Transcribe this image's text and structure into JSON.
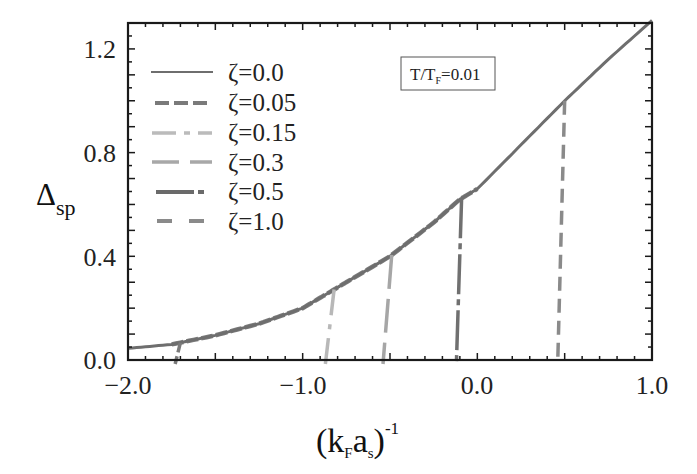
{
  "chart_data": {
    "type": "line",
    "title": "",
    "xlabel": "(k_F a_s)^-1",
    "xlabel_parts": {
      "open": "(k",
      "sub1": "F",
      "mid": "a",
      "sub2": "s",
      "close": ")",
      "sup": "-1"
    },
    "ylabel": "Δ_sp",
    "ylabel_parts": {
      "main": "Δ",
      "sub": "sp"
    },
    "xlim": [
      -2.0,
      1.0
    ],
    "ylim": [
      0.0,
      1.3
    ],
    "xticks": [
      -2.0,
      -1.0,
      0.0,
      1.0
    ],
    "xtick_labels": [
      "−2.0",
      "−1.0",
      "0.0",
      "1.0"
    ],
    "yticks": [
      0.0,
      0.4,
      0.8,
      1.2
    ],
    "ytick_labels": [
      "0.0",
      "0.4",
      "0.8",
      "1.2"
    ],
    "grid": false,
    "legend_position": "upper left",
    "annotation": {
      "text_main": "T/T",
      "text_sub": "F",
      "text_rest": "=0.01"
    },
    "series": [
      {
        "name": "ζ=0.0",
        "style": "solid",
        "color": "#6e6e6e",
        "x": [
          -2.0,
          -1.75,
          -1.5,
          -1.25,
          -1.0,
          -0.85,
          -0.75,
          -0.5,
          -0.25,
          -0.1,
          0.0,
          0.25,
          0.5,
          0.75,
          1.0
        ],
        "y": [
          0.045,
          0.06,
          0.095,
          0.14,
          0.2,
          0.26,
          0.3,
          0.4,
          0.53,
          0.62,
          0.66,
          0.83,
          1.0,
          1.16,
          1.31
        ]
      },
      {
        "name": "ζ=0.05",
        "style": "dashed",
        "color": "#7a7a7a",
        "drop_x": -1.73,
        "x": [
          -1.75,
          -1.5,
          -1.25,
          -1.0,
          -0.85,
          -0.75,
          -0.5,
          -0.25,
          0.0,
          0.5,
          1.0
        ],
        "y": [
          0.06,
          0.095,
          0.14,
          0.2,
          0.26,
          0.3,
          0.4,
          0.53,
          0.66,
          1.0,
          1.31
        ]
      },
      {
        "name": "ζ=0.15",
        "style": "dash-dot-light",
        "color": "#b8b8b8",
        "drop_x": -0.87,
        "x": [
          -0.85
        ],
        "y": [
          0.26
        ]
      },
      {
        "name": "ζ=0.3",
        "style": "long-dash",
        "color": "#a6a6a6",
        "drop_x": -0.54,
        "x": [
          -0.5
        ],
        "y": [
          0.4
        ]
      },
      {
        "name": "ζ=0.5",
        "style": "dash-dot",
        "color": "#707070",
        "drop_x": -0.12,
        "x": [
          -0.1
        ],
        "y": [
          0.62
        ]
      },
      {
        "name": "ζ=1.0",
        "style": "dashed",
        "color": "#8a8a8a",
        "drop_x": 0.46,
        "x": [
          0.5
        ],
        "y": [
          1.0
        ]
      }
    ]
  },
  "legend": {
    "items": [
      {
        "label": "ζ=0.0"
      },
      {
        "label": "ζ=0.05"
      },
      {
        "label": "ζ=0.15"
      },
      {
        "label": "ζ=0.3"
      },
      {
        "label": "ζ=0.5"
      },
      {
        "label": "ζ=1.0"
      }
    ]
  }
}
